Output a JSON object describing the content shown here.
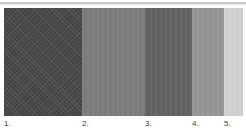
{
  "figure": {
    "name": "gray-value-swatch-strip",
    "background": "#ffffff",
    "rule_color": "#c8c8c8",
    "width": 246,
    "height": 133
  },
  "swatches": [
    {
      "label": "1.",
      "color": "#4a4a4a",
      "width_px": 78,
      "texture": "diagonal-weave"
    },
    {
      "label": "2.",
      "color": "#7d7d7d",
      "width_px": 63,
      "texture": "vertical-band"
    },
    {
      "label": "3.",
      "color": "#636363",
      "width_px": 47,
      "texture": "vertical-band"
    },
    {
      "label": "4.",
      "color": "#969696",
      "width_px": 32,
      "texture": "vertical-band"
    },
    {
      "label": "5.",
      "color": "#d2d2d2",
      "width_px": 19,
      "texture": "vertical-band"
    }
  ],
  "captions": [
    {
      "text": "1.",
      "left_px": 0
    },
    {
      "text": "2.",
      "left_px": 78
    },
    {
      "text": "3.",
      "left_px": 141
    },
    {
      "text": "4.",
      "left_px": 188
    },
    {
      "text": "5.",
      "left_px": 220
    }
  ]
}
